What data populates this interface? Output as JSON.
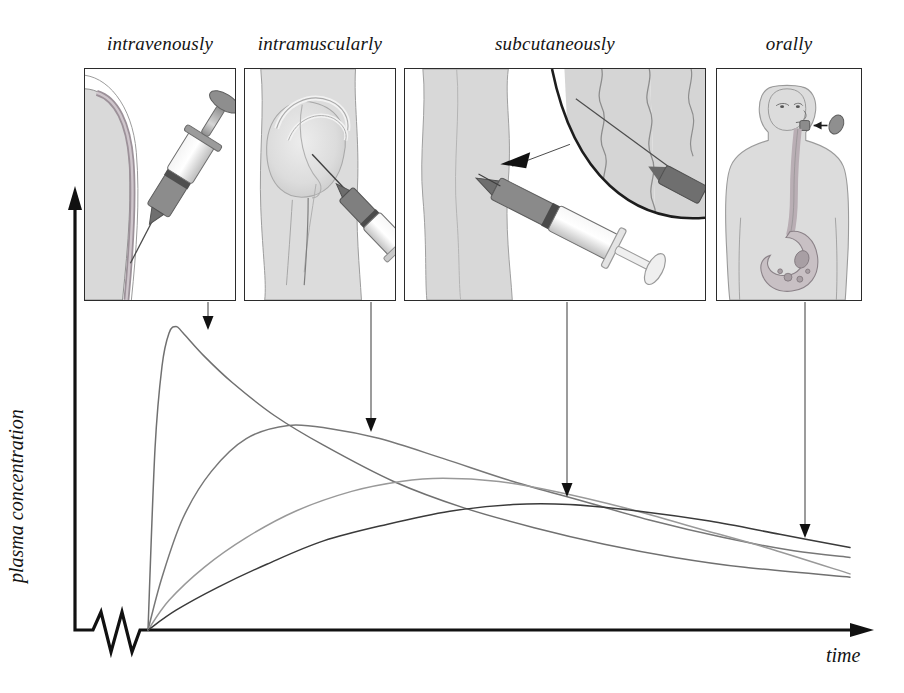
{
  "figure": {
    "background_color": "#ffffff",
    "caption_fragment": ""
  },
  "axes": {
    "y_label": "plasma concentration",
    "x_label": "time",
    "axis_color": "#111111",
    "has_axis_break": true,
    "break_symbol": "zigzag"
  },
  "panels": [
    {
      "id": "intravenously",
      "label": "intravenously",
      "illustration": "syringe-injecting-into-vein",
      "arrow_target_curve": "intravenous"
    },
    {
      "id": "intramuscularly",
      "label": "intramuscularly",
      "illustration": "syringe-injecting-into-gluteal-muscle",
      "arrow_target_curve": "intramuscular"
    },
    {
      "id": "subcutaneously",
      "label": "subcutaneously",
      "illustration": "syringe-injecting-under-skin-with-magnified-inset",
      "arrow_target_curve": "subcutaneous"
    },
    {
      "id": "orally",
      "label": "orally",
      "illustration": "torso-with-pill-esophagus-and-stomach",
      "arrow_target_curve": "oral"
    }
  ],
  "chart_data": {
    "type": "line",
    "title": "",
    "xlabel": "time",
    "ylabel": "plasma concentration",
    "xlim": [
      0,
      100
    ],
    "ylim": [
      0,
      100
    ],
    "grid": false,
    "legend": "none-arrows-from-panels",
    "axis_ticks": "none",
    "series": [
      {
        "name": "intravenous",
        "color": "#707070",
        "peak_time": 4,
        "peak_concentration": 92,
        "description": "near-instant rise to highest peak then monoexponential decline",
        "x": [
          0,
          1,
          2,
          3,
          4,
          5,
          8,
          12,
          18,
          25,
          35,
          45,
          55,
          65,
          75,
          85,
          100
        ],
        "y": [
          0,
          55,
          80,
          90,
          92,
          90,
          83,
          75,
          65,
          56,
          45,
          37,
          31,
          26,
          22,
          19,
          16
        ]
      },
      {
        "name": "intramuscular",
        "color": "#777777",
        "peak_time": 20,
        "peak_concentration": 62,
        "description": "moderate rise, intermediate peak, slower decline",
        "x": [
          0,
          2,
          5,
          9,
          14,
          20,
          26,
          33,
          42,
          52,
          62,
          72,
          82,
          92,
          100
        ],
        "y": [
          0,
          16,
          34,
          48,
          58,
          62,
          61,
          58,
          52,
          45,
          39,
          33,
          28,
          24,
          22
        ]
      },
      {
        "name": "subcutaneous",
        "color": "#999999",
        "peak_time": 42,
        "peak_concentration": 46,
        "description": "slow rise to low broad peak, gradual decline",
        "x": [
          0,
          3,
          8,
          14,
          21,
          29,
          36,
          42,
          50,
          58,
          68,
          78,
          88,
          100
        ],
        "y": [
          0,
          9,
          19,
          28,
          36,
          42,
          45,
          46,
          45,
          42,
          37,
          31,
          25,
          17
        ]
      },
      {
        "name": "oral",
        "color": "#3a3a3a",
        "peak_time": 52,
        "peak_concentration": 38,
        "description": "slowest rise, lowest flattest peak, most sustained levels",
        "x": [
          0,
          4,
          10,
          17,
          25,
          34,
          43,
          52,
          60,
          70,
          80,
          90,
          100
        ],
        "y": [
          0,
          6,
          13,
          20,
          27,
          32,
          36,
          38,
          38,
          36,
          33,
          29,
          25
        ]
      }
    ],
    "arrows": [
      {
        "from_panel": "intravenously",
        "to_series": "intravenous",
        "x": 208,
        "y_start": 302,
        "y_end": 330
      },
      {
        "from_panel": "intramuscularly",
        "to_series": "intramuscular",
        "x": 371,
        "y_start": 302,
        "y_end": 432
      },
      {
        "from_panel": "subcutaneously",
        "to_series": "subcutaneous",
        "x": 567,
        "y_start": 302,
        "y_end": 497
      },
      {
        "from_panel": "orally",
        "to_series": "oral",
        "x": 805,
        "y_start": 302,
        "y_end": 538
      }
    ]
  }
}
